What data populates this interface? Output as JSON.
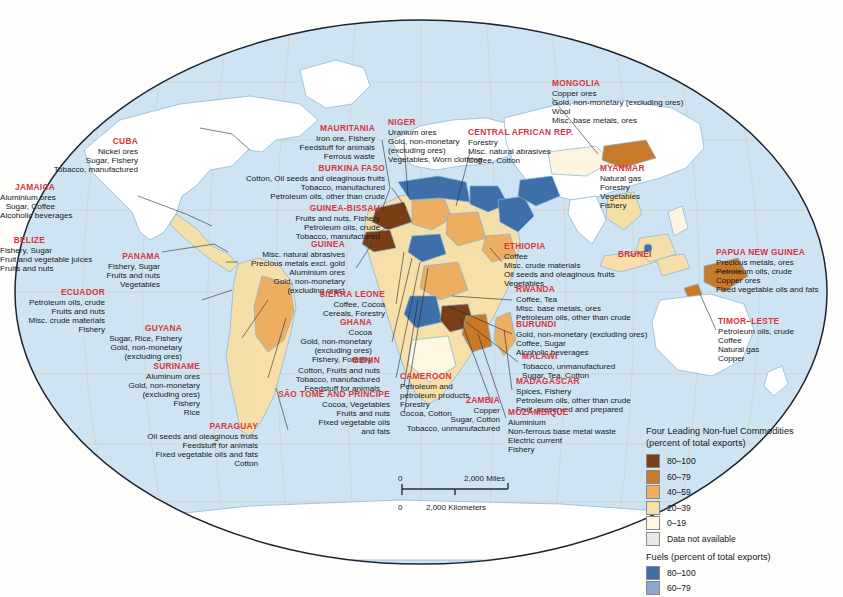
{
  "map": {
    "title": "World map of leading export commodities",
    "projection": "robinson-oval",
    "ocean_color": "#cfe4f2",
    "land_default": "#ffffff",
    "graticule_color": "#d7c9b8",
    "border_color": "#1b2430",
    "leader_line_color": "#1f2933"
  },
  "legend": {
    "title_line1": "Four Leading Non-fuel Commodities",
    "title_line2": "(percent of total exports)",
    "nonfuel_items": [
      {
        "label": "80–100",
        "color": "#7b3f18"
      },
      {
        "label": "60–79",
        "color": "#c97a28"
      },
      {
        "label": "40–59",
        "color": "#eeae62"
      },
      {
        "label": "20–39",
        "color": "#f6dfa8"
      },
      {
        "label": "0–19",
        "color": "#fdf6e0"
      },
      {
        "label": "Data not available",
        "color": "#e8e8e8"
      }
    ],
    "fuels_title": "Fuels (percent of total exports)",
    "fuels_items": [
      {
        "label": "80–100",
        "color": "#3f6fa8"
      },
      {
        "label": "60–79",
        "color": "#8aa8d0"
      }
    ]
  },
  "scale": {
    "zero_top": "0",
    "zero_bottom": "0",
    "miles_label": "2,000 Miles",
    "kilometers_label": "2,000 Kilometers"
  },
  "callouts": [
    {
      "id": "cuba",
      "name": "CUBA",
      "align": "right",
      "x": 138,
      "y": 137,
      "lines": [
        "Nickel ores",
        "Sugar, Fishery",
        "Tobacco, manufactured"
      ]
    },
    {
      "id": "jamaica",
      "name": "JAMAICA",
      "align": "right",
      "x": 55,
      "y": 183,
      "lines": [
        "Aluminium ores",
        "Sugar, Coffee",
        "Alcoholic beverages"
      ]
    },
    {
      "id": "belize",
      "name": "BELIZE",
      "align": "right",
      "x": 45,
      "y": 236,
      "lines": [
        "Fishery, Sugar",
        "Fruit and vegetable juices",
        "Fruits and nuts"
      ]
    },
    {
      "id": "panama",
      "name": "PANAMA",
      "align": "right",
      "x": 160,
      "y": 252,
      "lines": [
        "Fishery, Sugar",
        "Fruits and nuts",
        "Vegetables"
      ]
    },
    {
      "id": "ecuador",
      "name": "ECUADOR",
      "align": "right",
      "x": 105,
      "y": 288,
      "lines": [
        "Petroleum oils, crude",
        "Fruits and nuts",
        "Misc. crude materials",
        "Fishery"
      ]
    },
    {
      "id": "guyana",
      "name": "GUYANA",
      "align": "right",
      "x": 182,
      "y": 324,
      "lines": [
        "Sugar, Rice, Fishery",
        "Gold, non-monetary",
        "(excluding ores)"
      ]
    },
    {
      "id": "suriname",
      "name": "SURINAME",
      "align": "right",
      "x": 200,
      "y": 362,
      "lines": [
        "Aluminum ores",
        "Gold, non-monetary",
        "(excluding ores)",
        "Fishery",
        "Rice"
      ]
    },
    {
      "id": "paraguay",
      "name": "PARAGUAY",
      "align": "right",
      "x": 258,
      "y": 422,
      "lines": [
        "Oil seeds and oleaginous fruits",
        "Feedstuff for animals",
        "Fixed vegetable oils and fats",
        "Cotton"
      ]
    },
    {
      "id": "mauritania",
      "name": "MAURITANIA",
      "align": "right",
      "x": 375,
      "y": 124,
      "lines": [
        "Iron ore, Fishery",
        "Feedstuff for animals",
        "Ferrous waste"
      ]
    },
    {
      "id": "burkina-faso",
      "name": "BURKINA FASO",
      "align": "right",
      "x": 385,
      "y": 164,
      "lines": [
        "Cotton, Oil seeds and oleaginous fruits",
        "Tobacco, manufactured",
        "Petroleum oils, other than crude"
      ]
    },
    {
      "id": "guinea-bissau",
      "name": "GUINEA-BISSAU",
      "align": "right",
      "x": 380,
      "y": 204,
      "lines": [
        "Fruits and nuts, Fishery",
        "Petroleum oils, crude",
        "Tobacco, manufactured"
      ]
    },
    {
      "id": "guinea",
      "name": "GUINEA",
      "align": "right",
      "x": 345,
      "y": 240,
      "lines": [
        "Misc. natural abrasives",
        "Precious metals excl. gold",
        "Aluminium ores",
        "Gold, non-monetary",
        "(excluding ores)"
      ]
    },
    {
      "id": "sierra-leone",
      "name": "SIERRA LEONE",
      "align": "right",
      "x": 385,
      "y": 290,
      "lines": [
        "Coffee, Cocoa",
        "Cereals, Forestry"
      ]
    },
    {
      "id": "ghana",
      "name": "GHANA",
      "align": "right",
      "x": 372,
      "y": 318,
      "lines": [
        "Cocoa",
        "Gold, non-monetary",
        "(excluding ores)",
        "Fishery, Forestry"
      ]
    },
    {
      "id": "benin",
      "name": "BENIN",
      "align": "right",
      "x": 380,
      "y": 356,
      "lines": [
        "Cotton, Fruits and nuts",
        "Tobacco, manufactured",
        "Feedstuff for animals"
      ]
    },
    {
      "id": "sao-tome-and-principe",
      "name": "SÃO TOMÉ AND PRÍNCIPE",
      "align": "right",
      "x": 390,
      "y": 390,
      "lines": [
        "Cocoa, Vegetables",
        "Fruits and nuts",
        "Fixed vegetable oils",
        "and fats"
      ]
    },
    {
      "id": "niger",
      "name": "NIGER",
      "align": "left",
      "x": 388,
      "y": 118,
      "lines": [
        "Uranium ores",
        "Gold, non-monetary",
        "(excluding ores)",
        "Vegetables, Worn clothing"
      ]
    },
    {
      "id": "central-african-rep",
      "name": "CENTRAL AFRICAN REP.",
      "align": "left",
      "x": 468,
      "y": 128,
      "lines": [
        "Forestry",
        "Misc. natural abrasives",
        "Coffee, Cotton"
      ]
    },
    {
      "id": "cameroon",
      "name": "CAMEROON",
      "align": "left",
      "x": 400,
      "y": 372,
      "lines": [
        "Petroleum and",
        "petroleum products",
        "Forestry",
        "Cocoa, Cotton"
      ]
    },
    {
      "id": "zambia",
      "name": "ZAMBIA",
      "align": "right",
      "x": 500,
      "y": 396,
      "lines": [
        "Copper",
        "Sugar, Cotton",
        "Tobacco, unmanufactured"
      ]
    },
    {
      "id": "mongolia",
      "name": "MONGOLIA",
      "align": "left",
      "x": 552,
      "y": 79,
      "lines": [
        "Copper ores",
        "Gold, non-monetary (excluding ores)",
        "Wool",
        "Misc. base metals, ores"
      ]
    },
    {
      "id": "myanmar",
      "name": "MYANMAR",
      "align": "left",
      "x": 600,
      "y": 164,
      "lines": [
        "Natural gas",
        "Forestry",
        "Vegetables",
        "Fishery"
      ]
    },
    {
      "id": "ethiopia",
      "name": "ETHIOPIA",
      "align": "left",
      "x": 504,
      "y": 242,
      "lines": [
        "Coffee",
        "Misc. crude materials",
        "Oil seeds and oleaginous fruits",
        "Vegetables"
      ]
    },
    {
      "id": "brunei",
      "name": "BRUNEI",
      "align": "left",
      "x": 618,
      "y": 250,
      "lines": []
    },
    {
      "id": "rwanda",
      "name": "RWANDA",
      "align": "left",
      "x": 516,
      "y": 285,
      "lines": [
        "Coffee, Tea",
        "Misc. base metals, ores",
        "Petroleum oils, other than crude"
      ]
    },
    {
      "id": "burundi",
      "name": "BURUNDI",
      "align": "left",
      "x": 516,
      "y": 320,
      "lines": [
        "Gold, non-monetary (excluding ores)",
        "Coffee, Sugar",
        "Alcoholic beverages"
      ]
    },
    {
      "id": "malawi",
      "name": "MALAWI",
      "align": "left",
      "x": 522,
      "y": 352,
      "lines": [
        "Tobacco, unmanufactured",
        "Sugar, Tea, Cotton"
      ]
    },
    {
      "id": "madagascar",
      "name": "MADAGASCAR",
      "align": "left",
      "x": 516,
      "y": 377,
      "lines": [
        "Spices, Fishery",
        "Petroleum oils, other than crude",
        "Fruit, preserved and prepared"
      ]
    },
    {
      "id": "mozambique",
      "name": "MOZAMBIQUE",
      "align": "left",
      "x": 508,
      "y": 408,
      "lines": [
        "Aluminium",
        "Non-ferrous base metal waste",
        "Electric current",
        "Fishery"
      ]
    },
    {
      "id": "papua-new-guinea",
      "name": "PAPUA NEW GUINEA",
      "align": "left",
      "x": 716,
      "y": 248,
      "lines": [
        "Precious metals, ores",
        "Petroleum oils, crude",
        "Copper ores",
        "Fixed vegetable oils and fats"
      ]
    },
    {
      "id": "timor-leste",
      "name": "TIMOR–LESTE",
      "align": "left",
      "x": 718,
      "y": 317,
      "lines": [
        "Petroleum oils, crude",
        "Coffee",
        "Natural gas",
        "Copper"
      ]
    }
  ]
}
